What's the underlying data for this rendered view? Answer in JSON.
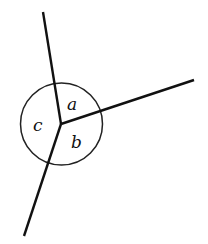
{
  "diagram": {
    "type": "angles-around-a-point",
    "vertex": {
      "x": 61,
      "y": 124
    },
    "circle": {
      "cx": 61.5,
      "cy": 124,
      "r": 41
    },
    "rays": [
      {
        "name": "ray-up",
        "x2": 43,
        "y2": 12
      },
      {
        "name": "ray-right",
        "x2": 194,
        "y2": 80
      },
      {
        "name": "ray-down",
        "x2": 24,
        "y2": 236
      }
    ],
    "labels": {
      "a": "a",
      "b": "b",
      "c": "c"
    },
    "colors": {
      "stroke": "#111111",
      "background": "#ffffff"
    }
  }
}
